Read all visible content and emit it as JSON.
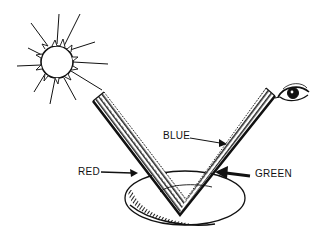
{
  "diagram": {
    "type": "illustration",
    "elements": {
      "sun": {
        "icon": "sun-icon",
        "center": [
          57,
          62
        ],
        "radius": 17
      },
      "eye": {
        "icon": "eye-icon",
        "center": [
          294,
          93
        ]
      },
      "surface": {
        "shape": "v-band",
        "apex": [
          180,
          213
        ],
        "left_end": [
          95,
          100
        ],
        "right_end": [
          273,
          95
        ]
      },
      "base": {
        "shape": "oval",
        "center": [
          185,
          198
        ],
        "rx": 60,
        "ry": 27
      }
    },
    "labels": {
      "red": "RED",
      "blue": "BLUE",
      "green": "GREEN"
    },
    "colors": {
      "ink": "#111111",
      "background": "#ffffff"
    }
  }
}
